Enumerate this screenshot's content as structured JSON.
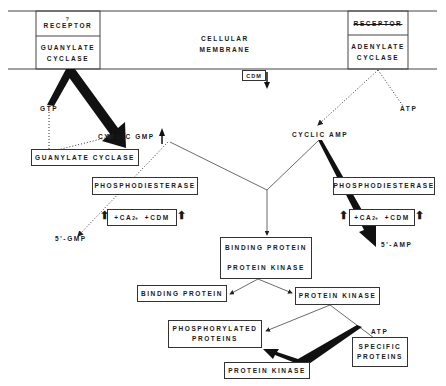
{
  "membrane": {
    "label_line1": "CELLULAR",
    "label_line2": "MEMBRANE",
    "left_receptor": {
      "mark": "?",
      "label": "RECEPTOR"
    },
    "left_enzyme": {
      "line1": "GUANYLATE",
      "line2": "CYCLASE"
    },
    "right_receptor": {
      "label": "RECEPTOR",
      "struck_through": true
    },
    "right_enzyme": {
      "line1": "ADENYLATE",
      "line2": "CYCLASE"
    },
    "cdm_box": "CDM"
  },
  "left_pathway": {
    "gtp": "GTP",
    "cyclic_gmp": "CYCLIC GMP",
    "guanylate_cyclase_box": "GUANYLATE CYCLASE",
    "phosphodiesterase_box": "PHOSPHODIESTERASE",
    "modulators": {
      "ca": "+CA",
      "ca_sup": "2+",
      "cdm": "+CDM"
    },
    "product": "5'-GMP"
  },
  "right_pathway": {
    "atp": "ATP",
    "cyclic_amp": "CYCLIC AMP",
    "phosphodiesterase_box": "PHOSPHODIESTERASE",
    "modulators": {
      "ca": "+CA",
      "ca_sup": "2+",
      "cdm": "+CDM"
    },
    "product": "5'-AMP"
  },
  "central_pathway": {
    "complex_top": "BINDING PROTEIN",
    "complex_bottom": "PROTEIN KINASE",
    "binding_protein": "BINDING PROTEIN",
    "protein_kinase": "PROTEIN KINASE",
    "phosphorylated_line1": "PHOSPHORYLATED",
    "phosphorylated_line2": "PROTEINS",
    "atp": "ATP",
    "specific_line1": "SPECIFIC",
    "specific_line2": "PROTEINS",
    "protein_kinase_bottom": "PROTEIN KINASE"
  },
  "colors": {
    "ink": "#1a1a1a",
    "line": "#333333",
    "background": "#ffffff"
  }
}
